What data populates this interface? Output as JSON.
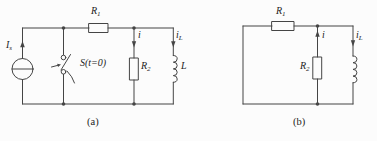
{
  "figure_ink": "#454545",
  "a": {
    "caption": "(a)",
    "source_label": {
      "base": "I",
      "sub": "s"
    },
    "switch_label": "S(t=0)",
    "r1_label": {
      "base": "R",
      "sub": "1"
    },
    "r2_label": {
      "base": "R",
      "sub": "2"
    },
    "i_label": "i",
    "il_label": {
      "base": "i",
      "sub": "L"
    },
    "l_label": "L"
  },
  "b": {
    "caption": "(b)",
    "r1_label": {
      "base": "R",
      "sub": "1"
    },
    "r2_label": {
      "base": "R",
      "sub": "2"
    },
    "i_label": "i",
    "il_label": {
      "base": "i",
      "sub": "L"
    }
  }
}
